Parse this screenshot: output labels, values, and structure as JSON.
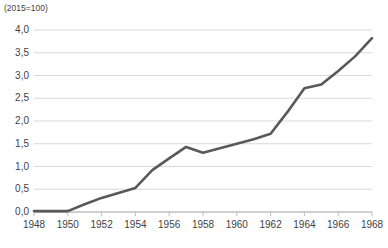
{
  "unit_note": "(2015=100)",
  "colors": {
    "line": "#595959",
    "gridline": "#d9d9d9",
    "axis": "#bfbfbf",
    "text": "#3f3f3f",
    "background": "#ffffff"
  },
  "chart_data": {
    "type": "line",
    "title": "",
    "subtitle": "",
    "annotations": [
      "(2015=100)"
    ],
    "xlabel": "",
    "ylabel": "",
    "xlim": [
      1948,
      1968
    ],
    "ylim": [
      0.0,
      4.0
    ],
    "grid": true,
    "legend": false,
    "legend_position": "none",
    "ytick_labels": [
      "0,0",
      "0,5",
      "1,0",
      "1,5",
      "2,0",
      "2,5",
      "3,0",
      "3,5",
      "4,0"
    ],
    "ytick_values": [
      0.0,
      0.5,
      1.0,
      1.5,
      2.0,
      2.5,
      3.0,
      3.5,
      4.0
    ],
    "xtick_labels": [
      "1948",
      "1950",
      "1952",
      "1954",
      "1956",
      "1958",
      "1960",
      "1962",
      "1964",
      "1966",
      "1968"
    ],
    "xtick_values": [
      1948,
      1950,
      1952,
      1954,
      1956,
      1958,
      1960,
      1962,
      1964,
      1966,
      1968
    ],
    "x": [
      1948,
      1949,
      1950,
      1951,
      1952,
      1953,
      1954,
      1955,
      1956,
      1957,
      1958,
      1959,
      1960,
      1961,
      1962,
      1963,
      1964,
      1965,
      1966,
      1967,
      1968
    ],
    "values": [
      0.02,
      0.02,
      0.02,
      0.17,
      0.31,
      0.42,
      0.53,
      0.92,
      1.18,
      1.43,
      1.3,
      1.4,
      1.5,
      1.6,
      1.72,
      2.2,
      2.72,
      2.8,
      3.1,
      3.42,
      3.82
    ],
    "series": [
      {
        "name": "index",
        "values": [
          0.02,
          0.02,
          0.02,
          0.17,
          0.31,
          0.42,
          0.53,
          0.92,
          1.18,
          1.43,
          1.3,
          1.4,
          1.5,
          1.6,
          1.72,
          2.2,
          2.72,
          2.8,
          3.1,
          3.42,
          3.82
        ]
      }
    ]
  }
}
